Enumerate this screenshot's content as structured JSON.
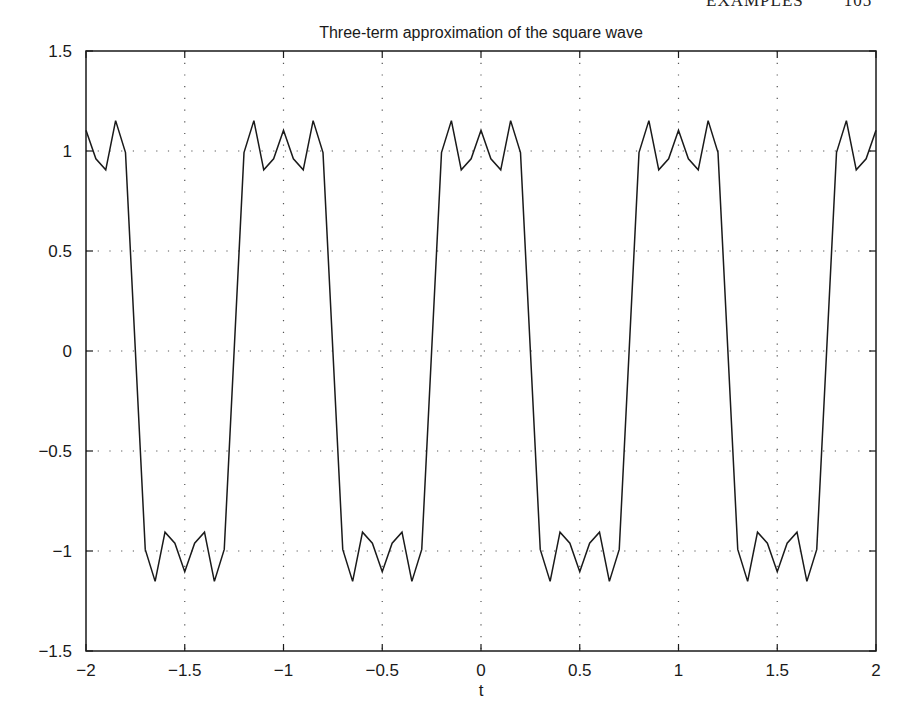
{
  "running_head": {
    "section": "EXAMPLES",
    "page": "105"
  },
  "chart_data": {
    "type": "line",
    "title": "Three-term approximation of the square wave",
    "xlabel": "t",
    "ylabel": "",
    "xlim": [
      -2,
      2
    ],
    "ylim": [
      -1.5,
      1.5
    ],
    "grid": true,
    "grid_style": "dotted",
    "legend": null,
    "x_ticks": [
      -2,
      -1.5,
      -1,
      -0.5,
      0,
      0.5,
      1,
      1.5,
      2
    ],
    "x_tick_labels": [
      "−2",
      "−1.5",
      "−1",
      "−0.5",
      "0",
      "0.5",
      "1",
      "1.5",
      "2"
    ],
    "y_ticks": [
      -1.5,
      -1,
      -0.5,
      0,
      0.5,
      1,
      1.5
    ],
    "y_tick_labels": [
      "−1.5",
      "−1",
      "−0.5",
      "0",
      "0.5",
      "1",
      "1.5"
    ],
    "sample_step": 0.05,
    "formula": "(4/pi)*(cos(2*pi*t) - cos(6*pi*t)/3 + cos(10*pi*t)/5)",
    "one_period_samples": {
      "t": [
        0,
        0.05,
        0.1,
        0.15,
        0.2,
        0.25,
        0.3,
        0.35,
        0.4,
        0.45,
        0.5,
        0.55,
        0.6,
        0.65,
        0.7,
        0.75,
        0.8,
        0.85,
        0.9,
        0.95
      ],
      "y": [
        1.104,
        0.961,
        0.906,
        1.152,
        0.992,
        0.0,
        -0.992,
        -1.152,
        -0.906,
        -0.961,
        -1.104,
        -0.961,
        -0.906,
        -1.152,
        -0.992,
        0.0,
        0.992,
        1.152,
        0.906,
        0.961
      ]
    },
    "series": [
      {
        "name": "three-term approximation",
        "color": "#1a1a1a"
      }
    ]
  }
}
